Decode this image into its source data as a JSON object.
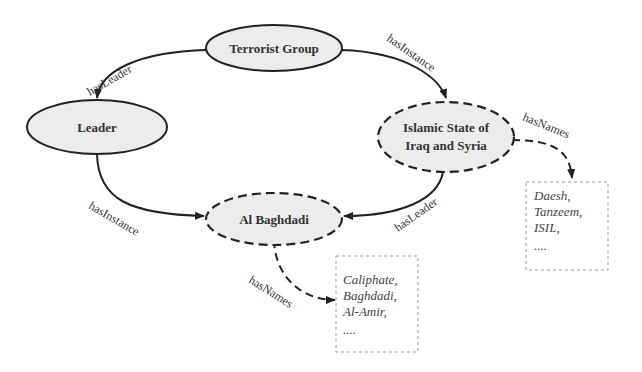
{
  "diagram": {
    "nodes": {
      "terrorist_group": {
        "label": "Terrorist Group",
        "style": "solid"
      },
      "leader": {
        "label": "Leader",
        "style": "solid"
      },
      "isis": {
        "label_line1": "Islamic State of",
        "label_line2": "Iraq and Syria",
        "style": "dashed"
      },
      "baghdadi": {
        "label": "Al Baghdadi",
        "style": "dashed"
      }
    },
    "edges": {
      "group_to_leader": {
        "label": "hasLeader"
      },
      "group_to_isis": {
        "label": "hasInstance"
      },
      "leader_to_baghdadi": {
        "label": "hasInstance"
      },
      "isis_to_baghdadi": {
        "label": "hasLeader"
      },
      "isis_names": {
        "label": "hasNames"
      },
      "baghdadi_names": {
        "label": "hasNames"
      }
    },
    "name_boxes": {
      "isis_names": {
        "items": [
          "Daesh,",
          "Tanzeem,",
          "ISIL,",
          "...."
        ]
      },
      "baghdadi_names": {
        "items": [
          "Caliphate,",
          "Baghdadi,",
          "Al-Amir,",
          "...."
        ]
      }
    },
    "colors": {
      "node_fill": "#ececec",
      "stroke": "#222222",
      "box_border": "#999999"
    }
  }
}
